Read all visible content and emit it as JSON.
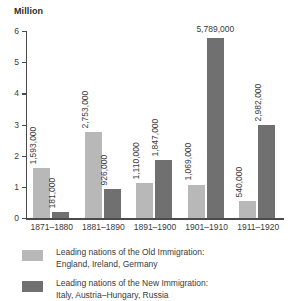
{
  "chart_data": {
    "type": "bar",
    "title": "",
    "ylabel": "Million",
    "xlabel": "",
    "ylim": [
      0,
      6
    ],
    "yticks": [
      "0",
      "1",
      "2",
      "3",
      "4",
      "5",
      "6"
    ],
    "grid": false,
    "legend_position": "bottom-left",
    "categories": [
      "1871–1880",
      "1881–1890",
      "1891–1900",
      "1901–1910",
      "1911–1920"
    ],
    "series": [
      {
        "name": "Leading nations of the Old Immigration: England, Ireland, Germany",
        "color": "#b8b8b8",
        "values": [
          1593000,
          2753000,
          1110000,
          1069000,
          540000
        ],
        "labels": [
          "1,593,000",
          "2,753,000",
          "1,110,000",
          "1,069,000",
          "540,000"
        ]
      },
      {
        "name": "Leading nations of the New Immigration: Italy, Austria–Hungary, Russia",
        "color": "#707070",
        "values": [
          181000,
          926000,
          1847000,
          5789000,
          2982000
        ],
        "labels": [
          "181,000",
          "926,000",
          "1,847,000",
          "5,789,000",
          "2,982,000"
        ]
      }
    ]
  },
  "legend": {
    "entries": [
      {
        "swatch": "#b8b8b8",
        "line1": "Leading nations of the Old Immigration:",
        "line2": "England, Ireland, Germany"
      },
      {
        "swatch": "#707070",
        "line1": "Leading nations of the New Immigration:",
        "line2": "Italy, Austria–Hungary, Russia"
      }
    ]
  }
}
